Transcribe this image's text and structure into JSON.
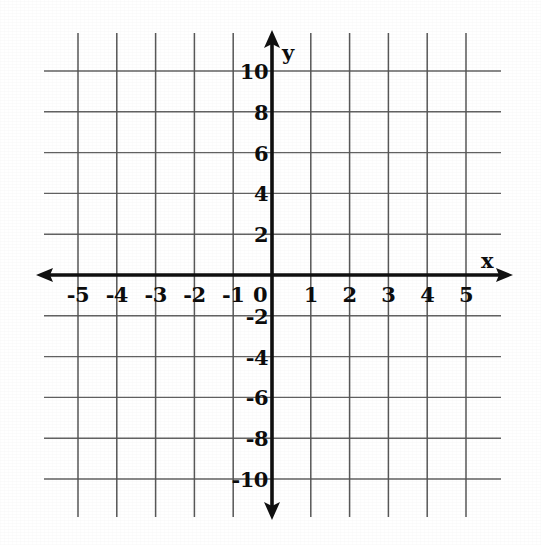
{
  "chart_data": {
    "type": "grid",
    "title": "",
    "subtitle": "",
    "xlabel": "x",
    "ylabel": "y",
    "xlim": [
      -5,
      5
    ],
    "ylim": [
      -10,
      10
    ],
    "x_tick_step": 1,
    "y_tick_step": 2,
    "grid": true,
    "legend": false,
    "series": [],
    "annotations": [],
    "origin_label": "0",
    "x_tick_labels": [
      "-5",
      "-4",
      "-3",
      "-2",
      "-1",
      "1",
      "2",
      "3",
      "4",
      "5"
    ],
    "y_tick_labels": [
      "10",
      "8",
      "6",
      "4",
      "2",
      "-2",
      "-4",
      "-6",
      "-8",
      "-10"
    ],
    "x_tick_values": [
      -5,
      -4,
      -3,
      -2,
      -1,
      1,
      2,
      3,
      4,
      5
    ],
    "y_tick_values": [
      10,
      8,
      6,
      4,
      2,
      -2,
      -4,
      -6,
      -8,
      -10
    ],
    "x_gridline_values": [
      -5,
      -4,
      -3,
      -2,
      -1,
      0,
      1,
      2,
      3,
      4,
      5
    ],
    "y_gridline_values": [
      10,
      8,
      6,
      4,
      2,
      0,
      -2,
      -4,
      -6,
      -8,
      -10
    ],
    "axis_arrows": [
      "left",
      "right",
      "up",
      "down"
    ],
    "colors": {
      "background": "#ffffff",
      "axis": "#111111",
      "gridline": "#4a4a4a",
      "label": "#0d0d0d"
    }
  }
}
